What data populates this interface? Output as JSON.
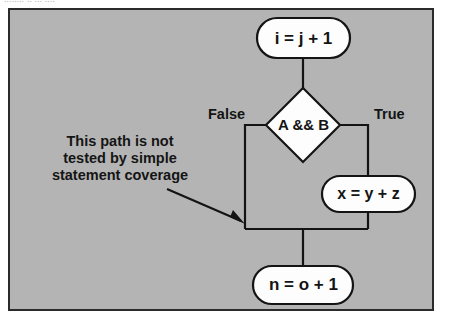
{
  "page": {
    "top_caption": "........ .. ... ....",
    "background_color": "#ffffff"
  },
  "figure": {
    "panel_color": "#b4b4b4",
    "border_color": "#2b2b2b",
    "shape_fill_color": "#fdfdfd",
    "line_color": "#141414",
    "nodes": {
      "top_statement": "i = j + 1",
      "decision": "A && B",
      "true_statement": "x = y + z",
      "bottom_statement": "n = o + 1"
    },
    "branch_labels": {
      "false": "False",
      "true": "True"
    },
    "annotation": {
      "line1": "This path is not",
      "line2": "tested by simple",
      "line3": "statement coverage"
    }
  }
}
